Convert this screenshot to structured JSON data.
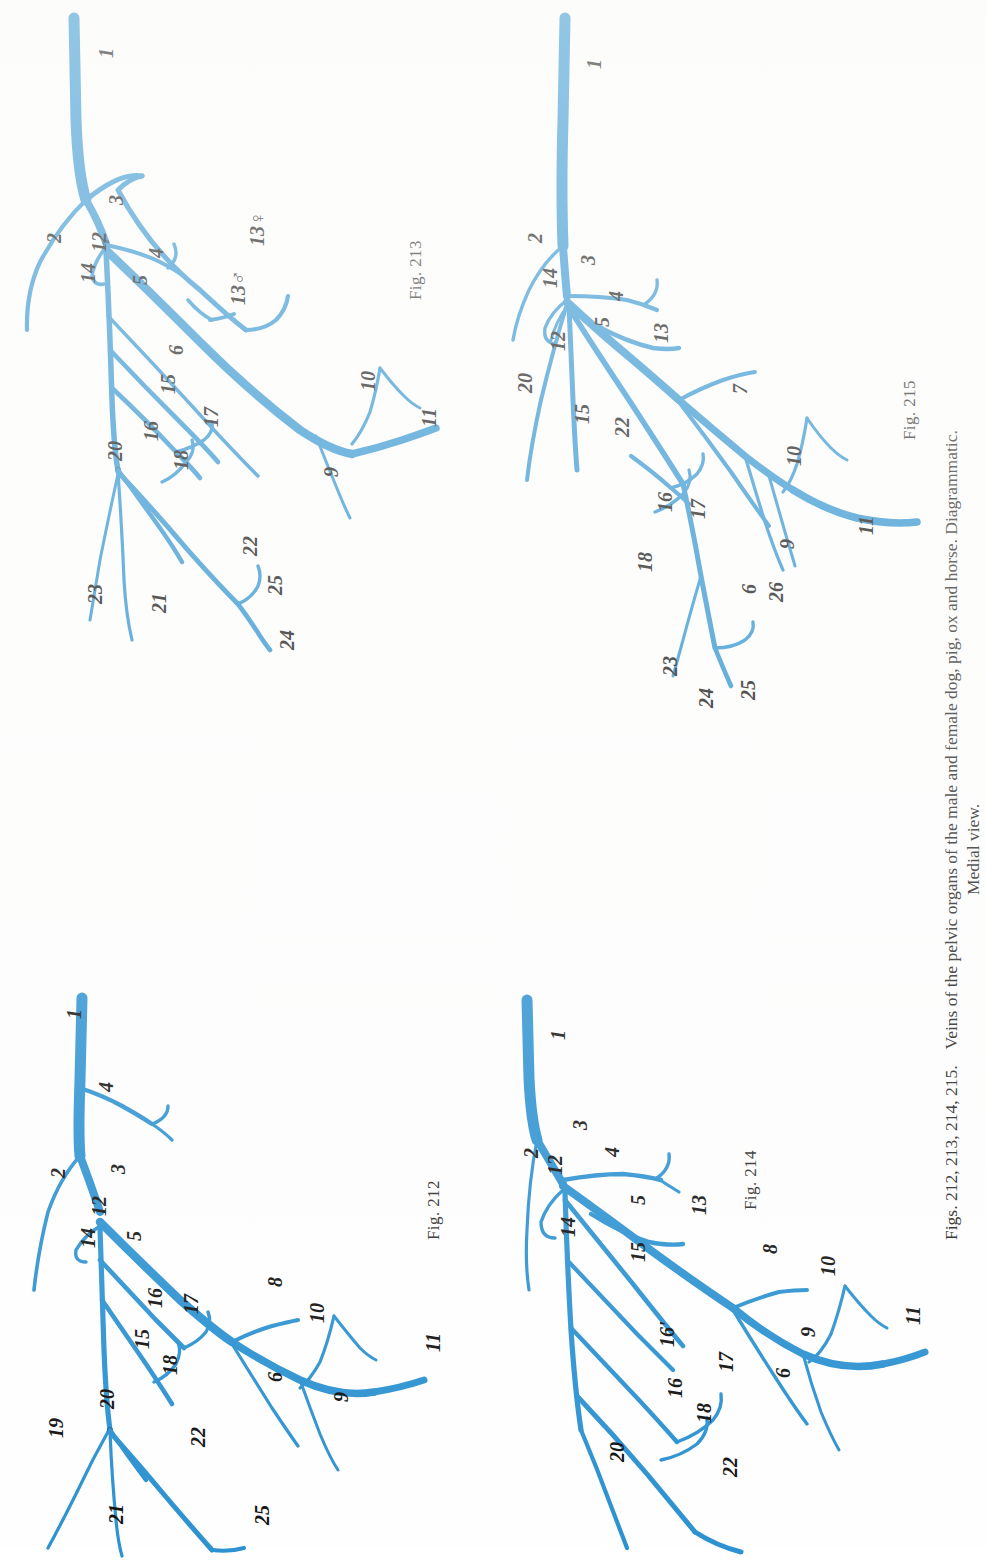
{
  "plate": {
    "caption_line1_prefix": "Figs. 212, 213, 214, 215.",
    "caption_line1_body": "Veins of the pelvic organs of the male and female dog, pig, ox and horse. Diagrammatic.",
    "caption_line2": "Medial view.",
    "vessel_color": "#2c92d1",
    "vessel_color_light": "#3fa0da",
    "label_color": "#111111",
    "background": "#ffffff"
  },
  "figures": [
    {
      "id": "fig-213",
      "number_label": "Fig. 213",
      "position": "top-left",
      "labels": [
        "1",
        "2",
        "3",
        "4",
        "5",
        "13♂",
        "13♀",
        "6",
        "15",
        "16",
        "17",
        "18",
        "20",
        "21",
        "22",
        "23",
        "24",
        "25",
        "9",
        "10",
        "11",
        "12",
        "14"
      ]
    },
    {
      "id": "fig-215",
      "number_label": "Fig. 215",
      "position": "top-right",
      "labels": [
        "1",
        "2",
        "3",
        "4",
        "5",
        "13",
        "7",
        "12",
        "14",
        "20",
        "15",
        "22",
        "16",
        "17",
        "18",
        "23",
        "24",
        "25",
        "6",
        "26",
        "9",
        "10",
        "11"
      ]
    },
    {
      "id": "fig-212",
      "number_label": "Fig. 212",
      "position": "bottom-left",
      "labels": [
        "1",
        "2",
        "3",
        "4",
        "12",
        "14",
        "5",
        "15",
        "16",
        "17",
        "18",
        "8",
        "10",
        "6",
        "9",
        "11",
        "19",
        "20",
        "21",
        "22",
        "25"
      ]
    },
    {
      "id": "fig-214",
      "number_label": "Fig. 214",
      "position": "bottom-right",
      "labels": [
        "1",
        "2",
        "3",
        "4",
        "12",
        "14",
        "5",
        "13",
        "15",
        "8",
        "10",
        "16'",
        "16",
        "17",
        "18",
        "6",
        "9",
        "11",
        "20",
        "22"
      ]
    }
  ],
  "fig213_labels": [
    {
      "t": "1",
      "x": 96,
      "y": 58
    },
    {
      "t": "2",
      "x": 44,
      "y": 243
    },
    {
      "t": "3",
      "x": 106,
      "y": 205
    },
    {
      "t": "4",
      "x": 146,
      "y": 258
    },
    {
      "t": "12",
      "x": 89,
      "y": 252
    },
    {
      "t": "14",
      "x": 78,
      "y": 283
    },
    {
      "t": "5",
      "x": 130,
      "y": 285
    },
    {
      "t": "13♂",
      "x": 228,
      "y": 305
    },
    {
      "t": "13♀",
      "x": 247,
      "y": 246
    },
    {
      "t": "6",
      "x": 166,
      "y": 355
    },
    {
      "t": "15",
      "x": 158,
      "y": 394
    },
    {
      "t": "16",
      "x": 141,
      "y": 441
    },
    {
      "t": "17",
      "x": 201,
      "y": 427
    },
    {
      "t": "18",
      "x": 171,
      "y": 470
    },
    {
      "t": "20",
      "x": 105,
      "y": 461
    },
    {
      "t": "21",
      "x": 149,
      "y": 613
    },
    {
      "t": "22",
      "x": 240,
      "y": 556
    },
    {
      "t": "23",
      "x": 85,
      "y": 604
    },
    {
      "t": "24",
      "x": 277,
      "y": 650
    },
    {
      "t": "25",
      "x": 265,
      "y": 595
    },
    {
      "t": "9",
      "x": 321,
      "y": 477
    },
    {
      "t": "10",
      "x": 358,
      "y": 391
    },
    {
      "t": "11",
      "x": 419,
      "y": 427
    }
  ],
  "fig215_labels": [
    {
      "t": "1",
      "x": 584,
      "y": 69
    },
    {
      "t": "2",
      "x": 525,
      "y": 243
    },
    {
      "t": "3",
      "x": 578,
      "y": 265
    },
    {
      "t": "4",
      "x": 606,
      "y": 301
    },
    {
      "t": "14",
      "x": 540,
      "y": 288
    },
    {
      "t": "12",
      "x": 548,
      "y": 351
    },
    {
      "t": "5",
      "x": 592,
      "y": 327
    },
    {
      "t": "13",
      "x": 651,
      "y": 343
    },
    {
      "t": "7",
      "x": 730,
      "y": 394
    },
    {
      "t": "20",
      "x": 515,
      "y": 393
    },
    {
      "t": "15",
      "x": 572,
      "y": 424
    },
    {
      "t": "22",
      "x": 612,
      "y": 437
    },
    {
      "t": "16",
      "x": 655,
      "y": 512
    },
    {
      "t": "17",
      "x": 688,
      "y": 519
    },
    {
      "t": "18",
      "x": 635,
      "y": 572
    },
    {
      "t": "23",
      "x": 660,
      "y": 676
    },
    {
      "t": "24",
      "x": 696,
      "y": 708
    },
    {
      "t": "25",
      "x": 738,
      "y": 700
    },
    {
      "t": "6",
      "x": 739,
      "y": 594
    },
    {
      "t": "26",
      "x": 766,
      "y": 602
    },
    {
      "t": "9",
      "x": 777,
      "y": 549
    },
    {
      "t": "10",
      "x": 784,
      "y": 466
    },
    {
      "t": "11",
      "x": 856,
      "y": 535
    }
  ],
  "fig212_labels": [
    {
      "t": "1",
      "x": 64,
      "y": 1019
    },
    {
      "t": "4",
      "x": 96,
      "y": 1092
    },
    {
      "t": "2",
      "x": 48,
      "y": 1178
    },
    {
      "t": "3",
      "x": 108,
      "y": 1174
    },
    {
      "t": "12",
      "x": 89,
      "y": 1216
    },
    {
      "t": "14",
      "x": 78,
      "y": 1248
    },
    {
      "t": "5",
      "x": 124,
      "y": 1241
    },
    {
      "t": "16",
      "x": 145,
      "y": 1308
    },
    {
      "t": "17",
      "x": 181,
      "y": 1314
    },
    {
      "t": "15",
      "x": 132,
      "y": 1349
    },
    {
      "t": "18",
      "x": 160,
      "y": 1375
    },
    {
      "t": "8",
      "x": 265,
      "y": 1287
    },
    {
      "t": "10",
      "x": 307,
      "y": 1323
    },
    {
      "t": "6",
      "x": 265,
      "y": 1382
    },
    {
      "t": "9",
      "x": 331,
      "y": 1402
    },
    {
      "t": "11",
      "x": 423,
      "y": 1352
    },
    {
      "t": "19",
      "x": 46,
      "y": 1438
    },
    {
      "t": "20",
      "x": 97,
      "y": 1409
    },
    {
      "t": "21",
      "x": 106,
      "y": 1524
    },
    {
      "t": "22",
      "x": 188,
      "y": 1447
    },
    {
      "t": "25",
      "x": 252,
      "y": 1525
    }
  ],
  "fig214_labels": [
    {
      "t": "1",
      "x": 548,
      "y": 1040
    },
    {
      "t": "2",
      "x": 521,
      "y": 1158
    },
    {
      "t": "3",
      "x": 570,
      "y": 1130
    },
    {
      "t": "4",
      "x": 602,
      "y": 1157
    },
    {
      "t": "12",
      "x": 545,
      "y": 1175
    },
    {
      "t": "14",
      "x": 558,
      "y": 1237
    },
    {
      "t": "5",
      "x": 628,
      "y": 1205
    },
    {
      "t": "13",
      "x": 689,
      "y": 1215
    },
    {
      "t": "15",
      "x": 628,
      "y": 1262
    },
    {
      "t": "8",
      "x": 760,
      "y": 1254
    },
    {
      "t": "10",
      "x": 818,
      "y": 1276
    },
    {
      "t": "16'",
      "x": 657,
      "y": 1347
    },
    {
      "t": "17",
      "x": 716,
      "y": 1372
    },
    {
      "t": "16",
      "x": 665,
      "y": 1398
    },
    {
      "t": "18",
      "x": 694,
      "y": 1423
    },
    {
      "t": "6",
      "x": 773,
      "y": 1378
    },
    {
      "t": "9",
      "x": 798,
      "y": 1337
    },
    {
      "t": "11",
      "x": 903,
      "y": 1325
    },
    {
      "t": "20",
      "x": 607,
      "y": 1462
    },
    {
      "t": "22",
      "x": 720,
      "y": 1477
    }
  ]
}
